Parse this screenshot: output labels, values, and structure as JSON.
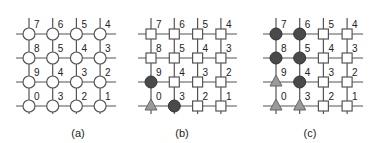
{
  "panels": [
    {
      "caption": "(a)",
      "x0": 29,
      "dx": 23.7,
      "y0": 34,
      "dy": 24,
      "capx": 78,
      "labels": [
        [
          "7",
          "6",
          "5",
          "4"
        ],
        [
          "8",
          "5",
          "4",
          "3"
        ],
        [
          "9",
          "4",
          "3",
          "2"
        ],
        [
          "0",
          "3",
          "2",
          "1"
        ]
      ],
      "shapes": [
        [
          "o",
          "o",
          "o",
          "o"
        ],
        [
          "o",
          "o",
          "o",
          "o"
        ],
        [
          "o",
          "o",
          "o",
          "o"
        ],
        [
          "o",
          "o",
          "o",
          "o"
        ]
      ]
    },
    {
      "caption": "(b)",
      "x0": 151,
      "dx": 23.3,
      "y0": 34,
      "dy": 24,
      "capx": 182,
      "labels": [
        [
          "7",
          "6",
          "5",
          "4"
        ],
        [
          "8",
          "5",
          "4",
          "3"
        ],
        [
          "9",
          "4",
          "3",
          "2"
        ],
        [
          "0",
          "3",
          "2",
          "1"
        ]
      ],
      "shapes": [
        [
          "s",
          "s",
          "s",
          "s"
        ],
        [
          "s",
          "s",
          "s",
          "s"
        ],
        [
          "c",
          "s",
          "s",
          "s"
        ],
        [
          "t",
          "c",
          "s",
          "s"
        ]
      ]
    },
    {
      "caption": "(c)",
      "x0": 276,
      "dx": 23.7,
      "y0": 34,
      "dy": 24,
      "capx": 310,
      "labels": [
        [
          "7",
          "6",
          "5",
          "4"
        ],
        [
          "8",
          "5",
          "4",
          "3"
        ],
        [
          "9",
          "4",
          "3",
          "2"
        ],
        [
          "0",
          "3",
          "2",
          "1"
        ]
      ],
      "shapes": [
        [
          "c",
          "c",
          "s",
          "s"
        ],
        [
          "c",
          "c",
          "s",
          "s"
        ],
        [
          "t",
          "c",
          "s",
          "s"
        ],
        [
          "t",
          "t",
          "s",
          "s"
        ]
      ]
    }
  ],
  "legend_semantics": {
    "o": "open-circle-node",
    "s": "open-square-node",
    "c": "filled-circle-node",
    "t": "triangle-node"
  },
  "colors": {
    "line": "#555555",
    "filled_circle": "#4a4a4a",
    "triangle": "#9a9a9a"
  }
}
